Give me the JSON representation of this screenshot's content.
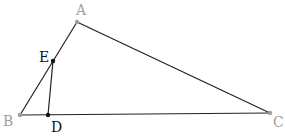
{
  "diagram": {
    "type": "geometry-triangle",
    "points": {
      "A": {
        "label": "A",
        "x": 77,
        "y": 22,
        "label_x": 76,
        "label_y": 15,
        "label_color": "#a0a0a0",
        "dot_color": "#a0a0a0"
      },
      "B": {
        "label": "B",
        "x": 20,
        "y": 115,
        "label_x": 3,
        "label_y": 126,
        "label_color": "#a0a0a0",
        "dot_color": "#a0a0a0"
      },
      "C": {
        "label": "C",
        "x": 270,
        "y": 113,
        "label_x": 273,
        "label_y": 127,
        "label_color": "#a0a0a0",
        "dot_color": "#a0a0a0"
      },
      "E": {
        "label": "E",
        "x": 53,
        "y": 61,
        "label_x": 39,
        "label_y": 62,
        "label_color": "#111111",
        "dot_color": "#111111"
      },
      "D": {
        "label": "D",
        "x": 48,
        "y": 115,
        "label_x": 51,
        "label_y": 132,
        "label_color": "#111111",
        "dot_color": "#111111"
      }
    },
    "segments": [
      {
        "from": "A",
        "to": "B"
      },
      {
        "from": "A",
        "to": "C"
      },
      {
        "from": "B",
        "to": "C"
      },
      {
        "from": "E",
        "to": "D"
      }
    ],
    "line_color": "#222222"
  }
}
